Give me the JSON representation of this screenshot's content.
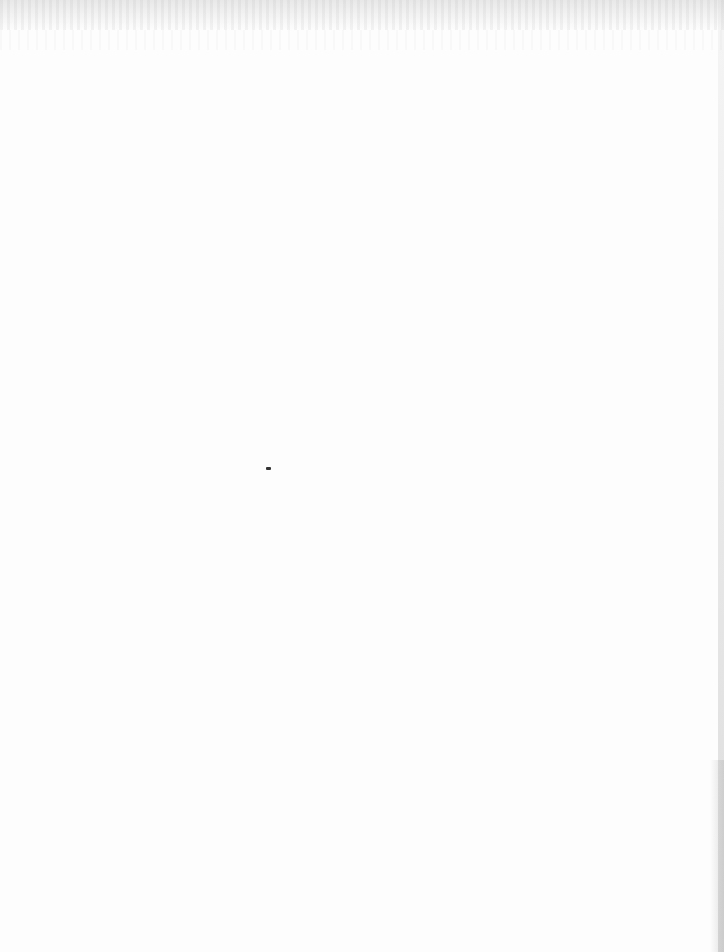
{
  "document": {
    "type": "blank scanned page",
    "text": "",
    "marks": [
      "bleed-through noise at top",
      "small speck near center",
      "edge shading on right"
    ]
  }
}
